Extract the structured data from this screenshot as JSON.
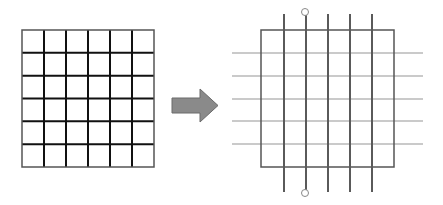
{
  "diagram": {
    "left_grid": {
      "rows": 6,
      "cols": 6,
      "x": 22,
      "y": 30,
      "width": 132,
      "height": 137,
      "inner_line_color": "#111111",
      "border_color": "#555555"
    },
    "arrow": {
      "direction": "right",
      "fill": "#8a8a8a",
      "stroke": "#6a6a6a"
    },
    "right_grid": {
      "box": {
        "x": 261,
        "y": 30,
        "width": 133,
        "height": 137,
        "color": "#555555"
      },
      "vertical_lines": {
        "x": [
          284,
          306,
          328,
          350,
          372
        ],
        "y_start": 14,
        "y_end": 192,
        "color": "#5a5a5a"
      },
      "horizontal_lines": {
        "y": [
          53,
          76,
          99,
          121,
          144
        ],
        "x_start": 232,
        "x_end": 423,
        "color": "#b8b8b8"
      },
      "terminals": [
        {
          "cx": 305,
          "cy": 12,
          "r": 3.5
        },
        {
          "cx": 305,
          "cy": 193,
          "r": 3.5
        }
      ]
    }
  }
}
